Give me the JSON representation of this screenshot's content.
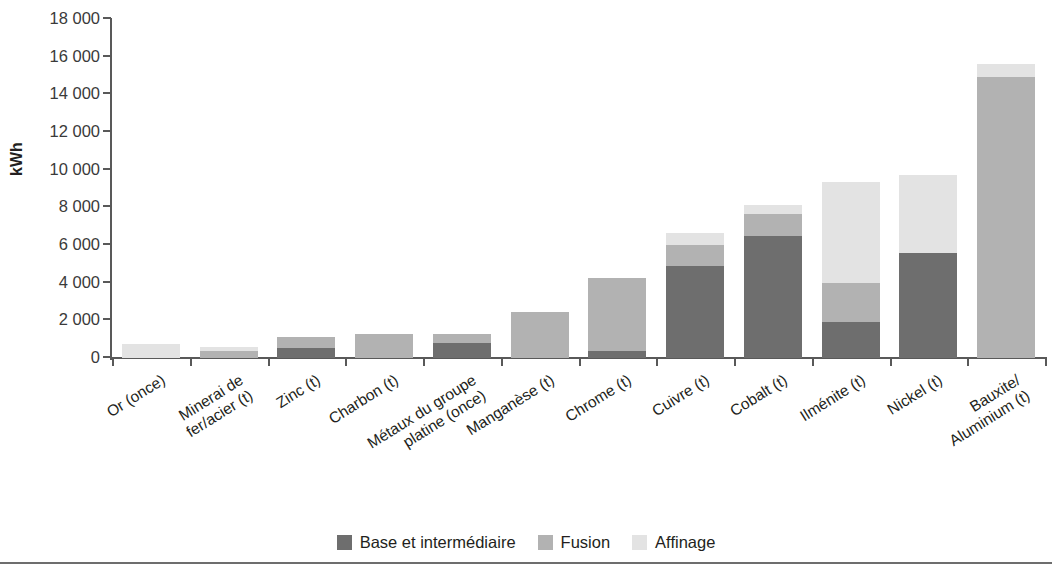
{
  "chart_data": {
    "type": "bar",
    "subtype": "stacked-vertical",
    "title": "",
    "xlabel": "",
    "ylabel": "kWh",
    "ylim": [
      0,
      18000
    ],
    "ytick_step": 2000,
    "ytick_labels": [
      "18 000",
      "16 000",
      "14 000",
      "12 000",
      "10 000",
      "8 000",
      "6 000",
      "4 000",
      "2 000",
      "0"
    ],
    "ytick_values": [
      18000,
      16000,
      14000,
      12000,
      10000,
      8000,
      6000,
      4000,
      2000,
      0
    ],
    "grid": false,
    "legend_position": "bottom-center",
    "categories": [
      "Or (once)",
      "Minerai de fer/acier (t)",
      "Zinc (t)",
      "Charbon (t)",
      "Métaux du groupe\nplatine (once)",
      "Manganèse (t)",
      "Chrome (t)",
      "Cuivre (t)",
      "Cobalt (t)",
      "Ilménite (t)",
      "Nickel (t)",
      "Bauxite/\nAluminium (t)"
    ],
    "series": [
      {
        "name": "Base et intermédiaire",
        "color": "#6e6e6e",
        "values": [
          0,
          0,
          550,
          0,
          800,
          0,
          350,
          4900,
          6500,
          1900,
          5550,
          0
        ]
      },
      {
        "name": "Fusion",
        "color": "#b2b2b2",
        "values": [
          0,
          380,
          550,
          1280,
          480,
          2450,
          3900,
          1100,
          1150,
          2100,
          0,
          14900
        ]
      },
      {
        "name": "Affinage",
        "color": "#e3e3e3",
        "values": [
          720,
          180,
          0,
          0,
          0,
          0,
          0,
          650,
          500,
          5350,
          4150,
          700
        ]
      }
    ],
    "totals": [
      720,
      560,
      1100,
      1280,
      1280,
      2450,
      4250,
      6650,
      8150,
      9350,
      9700,
      15600
    ]
  },
  "legend": {
    "items": [
      {
        "label": "Base et intermédiaire",
        "color": "#6e6e6e",
        "swatch": "legend-swatch-base"
      },
      {
        "label": "Fusion",
        "color": "#b2b2b2",
        "swatch": "legend-swatch-fusion"
      },
      {
        "label": "Affinage",
        "color": "#e3e3e3",
        "swatch": "legend-swatch-affinage"
      }
    ]
  }
}
